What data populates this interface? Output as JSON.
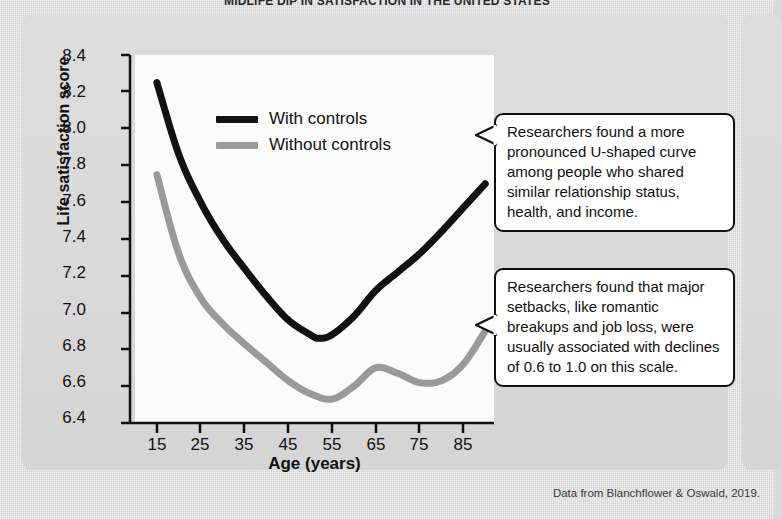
{
  "figure": {
    "title": "MIDLIFE DIP IN SATISFACTION IN THE UNITED STATES",
    "source_note": "Data from Blanchflower & Oswald, 2019."
  },
  "legend": {
    "items": [
      {
        "label": "With controls",
        "color": "#111111"
      },
      {
        "label": "Without controls",
        "color": "#9a9a9a"
      }
    ]
  },
  "callouts": [
    {
      "name": "callout-controls",
      "text": "Researchers found a more pronounced U-shaped curve among people who shared similar relationship status, health, and income."
    },
    {
      "name": "callout-setbacks",
      "text": "Researchers found that major setbacks, like romantic breakups and job loss, were usually associated with declines of 0.6 to 1.0 on this scale."
    }
  ],
  "chart_data": {
    "type": "line",
    "title": "MIDLIFE DIP IN SATISFACTION IN THE UNITED STATES",
    "xlabel": "Age (years)",
    "ylabel": "Life satisfaction score",
    "xlim": [
      10,
      92
    ],
    "ylim": [
      6.4,
      8.4
    ],
    "xticks": [
      15,
      25,
      35,
      45,
      55,
      65,
      75,
      85
    ],
    "yticks": [
      6.4,
      6.6,
      6.8,
      7.0,
      7.2,
      7.4,
      7.6,
      7.8,
      8.0,
      8.2,
      8.4
    ],
    "grid": false,
    "legend_position": "upper-center",
    "series": [
      {
        "name": "With controls",
        "color": "#111111",
        "x": [
          15,
          20,
          25,
          30,
          35,
          40,
          45,
          50,
          52,
          55,
          60,
          65,
          70,
          75,
          80,
          85,
          90
        ],
        "values": [
          8.25,
          7.86,
          7.6,
          7.4,
          7.24,
          7.09,
          6.96,
          6.88,
          6.86,
          6.88,
          6.98,
          7.12,
          7.22,
          7.32,
          7.44,
          7.57,
          7.7
        ]
      },
      {
        "name": "Without controls",
        "color": "#9a9a9a",
        "x": [
          15,
          20,
          25,
          30,
          35,
          40,
          45,
          50,
          55,
          60,
          65,
          70,
          75,
          80,
          85,
          90
        ],
        "values": [
          7.75,
          7.32,
          7.08,
          6.94,
          6.83,
          6.73,
          6.63,
          6.56,
          6.53,
          6.6,
          6.7,
          6.67,
          6.62,
          6.63,
          6.72,
          6.9
        ]
      }
    ]
  },
  "axes": {
    "y_tick_labels": [
      "8.4",
      "8.2",
      "8.0",
      "7.8",
      "7.6",
      "7.4",
      "7.2",
      "7.0",
      "6.8",
      "6.6",
      "6.4"
    ],
    "x_tick_labels": [
      "15",
      "25",
      "35",
      "45",
      "55",
      "65",
      "75",
      "85"
    ]
  }
}
